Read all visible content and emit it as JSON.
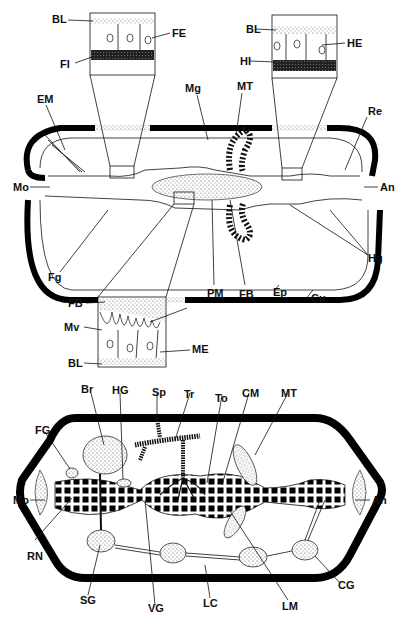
{
  "figure": {
    "top_diagram": {
      "description": "Longitudinal section of insect body showing gut regions",
      "labels": {
        "BL_fore": "BL",
        "FE": "FE",
        "FI": "FI",
        "BL_hind": "BL",
        "HE": "HE",
        "HI": "HI",
        "EM": "EM",
        "Mg": "Mg",
        "MT": "MT",
        "Re": "Re",
        "Mo": "Mo",
        "An": "An",
        "Fg": "Fg",
        "Hg": "Hg",
        "PM": "PM",
        "FB": "FB",
        "Ep": "Ep",
        "Cu": "Cu"
      },
      "midgut_inset": {
        "FB": "FB",
        "Mv": "Mv",
        "BL": "BL",
        "ME": "ME"
      }
    },
    "bottom_diagram": {
      "description": "Insect body showing nervous, tracheal and muscular systems",
      "labels": {
        "Br": "Br",
        "HG": "HG",
        "Sp": "Sp",
        "Tr": "Tr",
        "To": "To",
        "CM": "CM",
        "MT": "MT",
        "FG": "FG",
        "Mo": "Mo",
        "An": "An",
        "RN": "RN",
        "SG": "SG",
        "VG": "VG",
        "LC": "LC",
        "LM": "LM",
        "CG": "CG"
      }
    },
    "colors": {
      "ink": "#111111",
      "background": "#ffffff",
      "stipple": "#bbbbbb"
    }
  }
}
